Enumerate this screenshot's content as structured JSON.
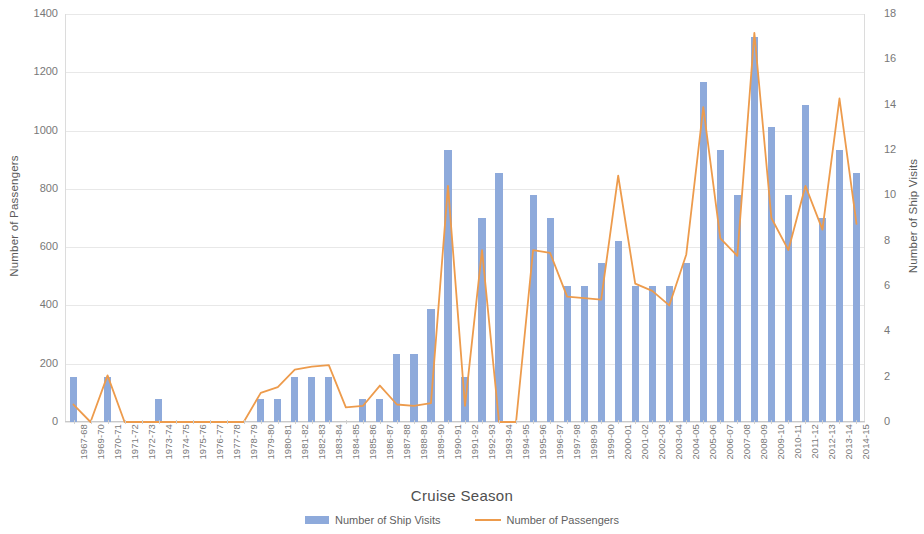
{
  "chart_data": {
    "type": "bar",
    "title": "",
    "xlabel": "Cruise Season",
    "ylabel": "Number of Passengers",
    "y2label": "Number of Ship Visits",
    "ylim": [
      0,
      1400
    ],
    "y2lim": [
      0,
      18
    ],
    "ytick_step": 200,
    "y2tick_step": 2,
    "grid": true,
    "legend_position": "bottom",
    "yticks": [
      "0",
      "200",
      "400",
      "600",
      "800",
      "1000",
      "1200",
      "1400"
    ],
    "y2ticks": [
      "0",
      "2",
      "4",
      "6",
      "8",
      "10",
      "12",
      "14",
      "16",
      "18"
    ],
    "categories": [
      "1967-68",
      "1969-70",
      "1970-71",
      "1971-72",
      "1972-73",
      "1973-74",
      "1974-75",
      "1975-76",
      "1976-77",
      "1977-78",
      "1978-79",
      "1979-80",
      "1980-81",
      "1981-82",
      "1982-83",
      "1983-84",
      "1984-85",
      "1985-86",
      "1986-87",
      "1987-88",
      "1988-89",
      "1989-90",
      "1990-91",
      "1991-92",
      "1992-93",
      "1993-94",
      "1994-95",
      "1995-96",
      "1996-97",
      "1997-98",
      "1998-99",
      "1999-00",
      "2000-01",
      "2001-02",
      "2002-03",
      "2003-04",
      "2004-05",
      "2005-06",
      "2006-07",
      "2007-08",
      "2008-09",
      "2009-10",
      "2010-11",
      "2011-12",
      "2012-13",
      "2013-14",
      "2014-15"
    ],
    "series": [
      {
        "name": "Number of Ship Visits",
        "axis": "right",
        "kind": "bar",
        "color": "#8eaadb",
        "values": [
          2,
          0,
          2,
          0,
          0,
          1,
          0,
          0,
          0,
          0,
          0,
          1,
          1,
          2,
          2,
          2,
          0,
          1,
          1,
          3,
          3,
          5,
          12,
          2,
          9,
          11,
          0,
          10,
          9,
          6,
          6,
          7,
          8,
          6,
          6,
          6,
          7,
          15,
          12,
          10,
          17,
          13,
          10,
          14,
          9,
          12,
          11
        ]
      },
      {
        "name": "Number of Passengers",
        "axis": "left",
        "kind": "line",
        "color": "#ed9b4c",
        "values": [
          60,
          0,
          160,
          0,
          0,
          0,
          0,
          0,
          0,
          0,
          0,
          100,
          120,
          180,
          190,
          195,
          50,
          55,
          125,
          60,
          55,
          65,
          810,
          55,
          590,
          0,
          0,
          590,
          580,
          430,
          425,
          420,
          845,
          475,
          450,
          400,
          575,
          1080,
          630,
          570,
          1335,
          700,
          590,
          810,
          660,
          1110,
          680
        ]
      }
    ]
  },
  "legend": {
    "items": [
      {
        "label": "Number of Ship Visits",
        "type": "bar",
        "color": "#8eaadb"
      },
      {
        "label": "Number of Passengers",
        "type": "line",
        "color": "#ed9b4c"
      }
    ]
  }
}
